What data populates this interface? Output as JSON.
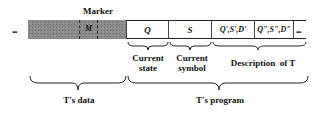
{
  "marker_label": "Marker",
  "marker_cell": "M",
  "left_ellipsis": "...",
  "right_ellipsis": "...",
  "cells": [
    {
      "text": "Q"
    },
    {
      "text": "S"
    },
    {
      "text": "Q',S',D'"
    },
    {
      "text": "Q\",S\",D\""
    }
  ],
  "labels": {
    "current_state": [
      "Current",
      "state"
    ],
    "current_symbol": [
      "Current",
      "symbol"
    ],
    "description": "Description  of T"
  },
  "bottom_labels": {
    "data": "T's data",
    "program": "T's program"
  },
  "colors": {
    "data_region": "#8a8a8a",
    "program_region": "#ffffff",
    "lines": "#222222"
  }
}
